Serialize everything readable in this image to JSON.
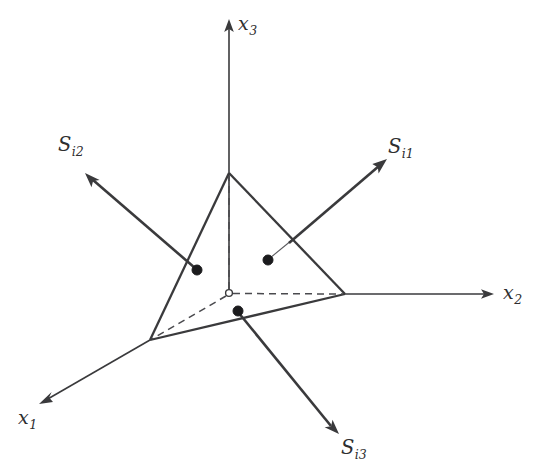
{
  "figure": {
    "kind": "3d-coordinate-diagram",
    "background_color": "#ffffff",
    "line_color": "#3a3a3c",
    "dot_color": "#1b1b1d",
    "width": 543,
    "height": 475
  },
  "axes": [
    {
      "name": "x3-axis",
      "label_base": "x",
      "label_sub": "3",
      "label_x": 238,
      "label_y": 14,
      "from": [
        229,
        293
      ],
      "to": [
        229,
        22
      ],
      "arrow": "up"
    },
    {
      "name": "x2-axis",
      "label_base": "x",
      "label_sub": "2",
      "label_x": 503,
      "label_y": 283,
      "from": [
        345,
        294
      ],
      "to": [
        493,
        294
      ],
      "arrow": "right"
    },
    {
      "name": "x1-axis",
      "label_base": "x",
      "label_sub": "1",
      "label_x": 18,
      "label_y": 408,
      "from": [
        150,
        340
      ],
      "to": [
        40,
        403
      ],
      "arrow": "down-left"
    }
  ],
  "vectors": [
    {
      "name": "s-i1-vector",
      "label_base": "S",
      "label_sub": "i1",
      "label_x": 388,
      "label_y": 137,
      "origin_dot": [
        268,
        260
      ],
      "stub_to": [
        291,
        241
      ],
      "tip": [
        386,
        160
      ],
      "arrow": "up-right"
    },
    {
      "name": "s-i2-vector",
      "label_base": "S",
      "label_sub": "i2",
      "label_x": 58,
      "label_y": 135,
      "origin_dot": [
        197,
        270
      ],
      "stub_to": [
        197,
        270
      ],
      "tip": [
        86,
        174
      ],
      "arrow": "up-left"
    },
    {
      "name": "s-i3-vector",
      "label_base": "S",
      "label_sub": "i3",
      "label_x": 341,
      "label_y": 438,
      "origin_dot": [
        238,
        311
      ],
      "stub_to": [
        238,
        311
      ],
      "tip": [
        339,
        433
      ],
      "arrow": "down-right"
    }
  ],
  "triangle": {
    "name": "oblique-plane-triangle",
    "vertices": [
      [
        229,
        173
      ],
      [
        345,
        294
      ],
      [
        150,
        340
      ]
    ]
  },
  "dashed_lines": [
    {
      "name": "origin-to-x3-vertex",
      "from": [
        229,
        291
      ],
      "to": [
        229,
        176
      ]
    },
    {
      "name": "origin-to-x2-vertex",
      "from": [
        232,
        293
      ],
      "to": [
        343,
        294
      ]
    },
    {
      "name": "origin-to-x1-vertex",
      "from": [
        227,
        295
      ],
      "to": [
        152,
        339
      ]
    }
  ],
  "origin": {
    "name": "origin-marker",
    "point": [
      229,
      293
    ],
    "radius": 3.4
  }
}
